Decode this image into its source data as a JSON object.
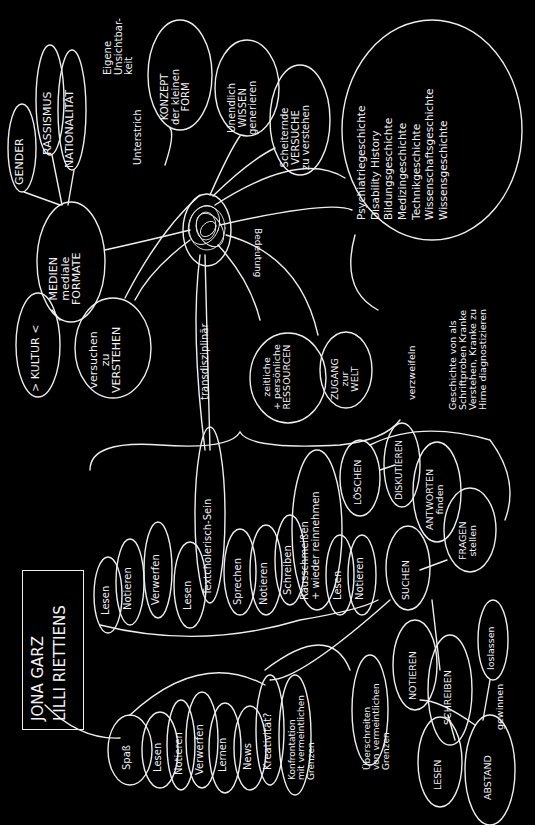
{
  "authors": {
    "line1": "JONA GARZ",
    "plus": "+",
    "line2": "LILLI RIETTIENS"
  },
  "top_cluster": {
    "gender": "GENDER",
    "rassismus": "RASSISMUS",
    "nationalitaet": "NATIONALITÄT",
    "kultur": "> KULTUR <",
    "medien": "MEDIEN\nmediale\nFORMATE",
    "verstehen": "versuchen\nzu\nVERSTEHEN",
    "eigene": "Eigene\nUnsichtbar-\nkeit",
    "unterstrich": "Unterstrich",
    "konzept": "KONZEPT\nder kleinen\nFORM",
    "wissen": "Unendlich\nWISSEN\ngenerieren",
    "versuche": "Scheiternde\nVERSUCHE\nzu verstehen",
    "history": "Psychiatriegeschichte\nDisability History\nBildungsgeschichte\nMedizingeschichte\nTechnikgeschichte\nWissenschaftsgeschichte\nWissensgeschichte",
    "transdisziplinaer": "transdisziplinär",
    "bedeutung": "Bedeutung",
    "ressourcen": "zeitliche\n+ persönliche\nRESSOURCEN",
    "zugang": "ZUGANG\nzur\nWELT",
    "verzweifeln": "verzweifeln",
    "geschichte": "Geschichte von als\nSchriftproben Kranke\nVerstehen, Kranke zu\nHirne diagnostizieren"
  },
  "middle_row": {
    "items": [
      "Lesen",
      "Notieren",
      "Verwerfen",
      "Lesen",
      "Textcholerisch-Sein",
      "Sprechen",
      "Notieren",
      "Schreiben",
      "Rausschmeißen\n+ wieder reinnehmen",
      "Lesen",
      "Notieren"
    ]
  },
  "right_cluster": {
    "loeschen": "LÖSCHEN",
    "diskutieren": "DISKUTIEREN",
    "antworten": "ANTWORTEN\nfinden",
    "suchen": "SUCHEN",
    "fragen": "FRAGEN\nstellen"
  },
  "bottom_row": {
    "items": [
      "Spaß",
      "Lesen",
      "Notieren",
      "Verwerfen",
      "Lernen",
      "News",
      "Kreativität?"
    ],
    "konfrontation": "Konfrontation\nmit vermeintlichen\nGrenzen",
    "ueberschreiten": "Überschreiten\nvon vermeintlichen\nGrenzen",
    "notieren": "NOTIEREN",
    "schreiben": "SCHREIBEN",
    "lesen": "LESEN",
    "abstand": "ABSTAND",
    "gewinnen": "gewinnen",
    "loslassen": "loslassen"
  },
  "colors": {
    "background": "#000000",
    "ink": "#f2f2f2"
  }
}
